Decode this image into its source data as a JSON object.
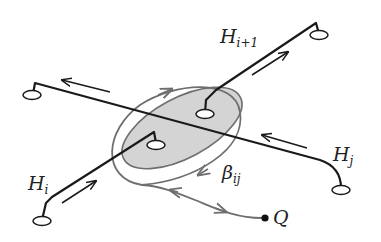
{
  "diagram": {
    "labels": {
      "h_i": {
        "main": "H",
        "sub": "i"
      },
      "h_i1": {
        "main": "H",
        "sub": "i+1"
      },
      "h_j": {
        "main": "H",
        "sub": "j"
      },
      "beta": {
        "main": "β",
        "sub": "ij"
      },
      "q": {
        "main": "Q"
      }
    },
    "colors": {
      "line": "#1a1a1a",
      "loop": "#6e6e6e",
      "shade": "#d4d4d4",
      "background": "#ffffff"
    }
  }
}
